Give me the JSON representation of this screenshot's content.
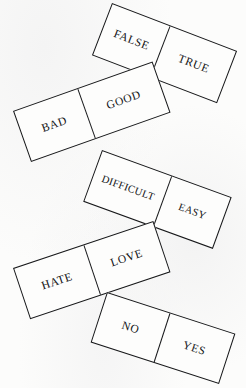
{
  "figure": {
    "type": "domino-chain-diagram",
    "background_color": "#fbfbfb",
    "stroke_color": "#17181a",
    "text_color": "#121315",
    "dominoes": [
      {
        "id": "false-true",
        "rotation_deg": 21,
        "left_label": "FALSE",
        "right_label": "TRUE"
      },
      {
        "id": "bad-good",
        "rotation_deg": -19.5,
        "left_label": "BAD",
        "right_label": "GOOD"
      },
      {
        "id": "difficult-easy",
        "rotation_deg": 20,
        "left_label": "DIFFICULT",
        "right_label": "EASY"
      },
      {
        "id": "hate-love",
        "rotation_deg": -18.5,
        "left_label": "HATE",
        "right_label": "LOVE"
      },
      {
        "id": "no-yes",
        "rotation_deg": 18,
        "left_label": "NO",
        "right_label": "YES"
      }
    ]
  }
}
